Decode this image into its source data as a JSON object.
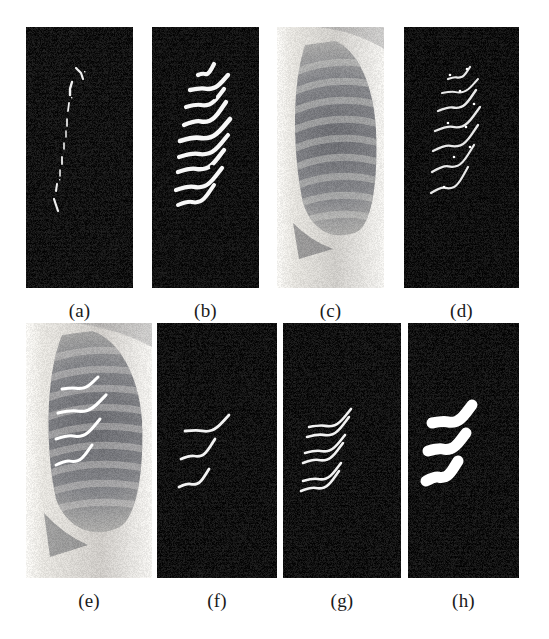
{
  "figure": {
    "background_color": "#ffffff",
    "rows": 2,
    "columns": 4,
    "panel_count": 8
  },
  "captions": {
    "a": "(a)",
    "b": "(b)",
    "c": "(c)",
    "d": "(d)",
    "e": "(e)",
    "f": "(f)",
    "g": "(g)",
    "h": "(h)"
  },
  "panels": [
    {
      "id": "a",
      "caption": "(a)",
      "kind": "binary-mask",
      "background_color": "#111111",
      "foreground_color": "#f2f2f2",
      "description": "sparse broken vertical edge fragments",
      "x": 26,
      "y": 27,
      "w": 107,
      "h": 261
    },
    {
      "id": "b",
      "caption": "(b)",
      "kind": "binary-mask",
      "background_color": "#111111",
      "foreground_color": "#f5f5f5",
      "description": "eight thick curved rib edge segments",
      "x": 152,
      "y": 27,
      "w": 107,
      "h": 261
    },
    {
      "id": "c",
      "caption": "(c)",
      "kind": "xray",
      "background_color": "#e8e6e2",
      "foreground_color": "#6a6a6a",
      "description": "chest radiograph lung field region of interest",
      "x": 277,
      "y": 27,
      "w": 107,
      "h": 261
    },
    {
      "id": "d",
      "caption": "(d)",
      "kind": "binary-mask",
      "background_color": "#111111",
      "foreground_color": "#e8e8e8",
      "description": "five thin curved rib border traces",
      "x": 404,
      "y": 27,
      "w": 115,
      "h": 261
    },
    {
      "id": "e",
      "caption": "(e)",
      "kind": "xray-overlay",
      "background_color": "#e8e6e2",
      "foreground_color": "#ffffff",
      "description": "chest radiograph with four detected rib borders overlaid in white",
      "x": 26,
      "y": 323,
      "w": 126,
      "h": 255
    },
    {
      "id": "f",
      "caption": "(f)",
      "kind": "binary-mask",
      "background_color": "#111111",
      "foreground_color": "#f0f0f0",
      "description": "three thin curved rib borders",
      "x": 157,
      "y": 323,
      "w": 120,
      "h": 255
    },
    {
      "id": "g",
      "caption": "(g)",
      "kind": "binary-mask",
      "background_color": "#111111",
      "foreground_color": "#f0f0f0",
      "description": "three pairs of upper and lower rib borders",
      "x": 283,
      "y": 323,
      "w": 118,
      "h": 255
    },
    {
      "id": "h",
      "caption": "(h)",
      "kind": "binary-mask",
      "background_color": "#111111",
      "foreground_color": "#ffffff",
      "description": "three solid filled rib bands",
      "x": 408,
      "y": 323,
      "w": 111,
      "h": 255
    }
  ],
  "colors": {
    "page_background": "#ffffff",
    "mask_background": "#111111",
    "mask_foreground": "#f5f5f5",
    "caption_text": "#1a1a1a",
    "xray_light": "#f0eeea",
    "xray_mid": "#9b9b97",
    "xray_dark": "#55565a"
  }
}
